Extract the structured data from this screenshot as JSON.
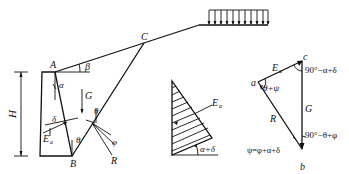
{
  "figure": {
    "wall": {
      "points": {
        "A": "A",
        "B": "B",
        "C": "C"
      },
      "height_label": "H",
      "angles": {
        "alpha": "α",
        "beta": "β",
        "delta": "δ",
        "theta": "θ",
        "phi": "φ"
      },
      "forces": {
        "G": "G",
        "Ea": "E",
        "Ea_sub": "a",
        "R": "R"
      }
    },
    "surcharge": {
      "label": "uniform load",
      "arrow_count": 11
    },
    "pressure_diagram": {
      "force_label": "E",
      "force_sub": "a",
      "angle_label": "α+δ"
    },
    "force_polygon": {
      "vertices": {
        "a": "a",
        "b": "b",
        "c": "c"
      },
      "Ea": "E",
      "Ea_sub": "a",
      "G": "G",
      "R": "R",
      "angle_a": "θ+ψ",
      "angle_c": "90°−α+δ",
      "angle_b": "90°−θ+φ",
      "psi_def": "ψ=φ+α+δ"
    }
  }
}
